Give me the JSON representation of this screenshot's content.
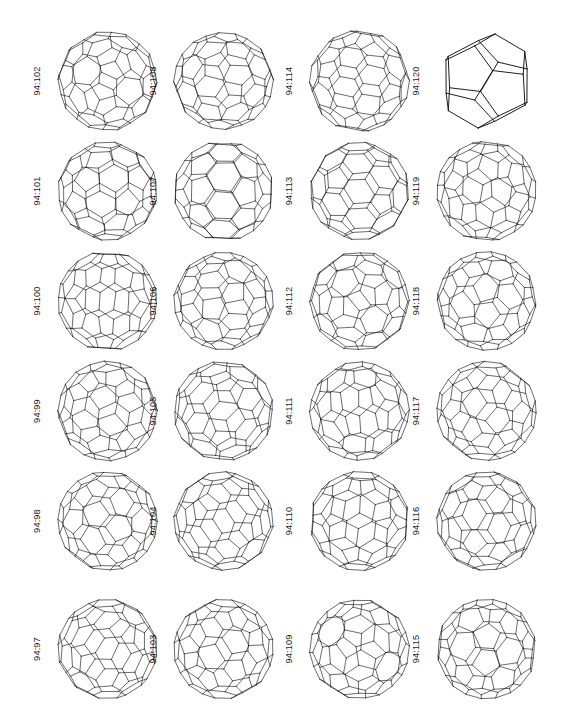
{
  "figure": {
    "kind": "fullerene-isomer-wireframe-plate",
    "background_color": "#ffffff",
    "line_color": "#111111",
    "grid": {
      "columns": 4,
      "rows": 6,
      "total_cells": 24
    },
    "label_orientation": "rotated-90-counterclockwise",
    "label_prefix": "94",
    "label_separator": ":"
  },
  "chart_data": {
    "type": "table",
    "title": "",
    "xlabel": "",
    "ylabel": "",
    "columns": 4,
    "rows": 6,
    "order": "column-major, bottom-to-top within each column",
    "categories": [
      "94:97",
      "94:98",
      "94:99",
      "94:100",
      "94:101",
      "94:102",
      "94:103",
      "94:104",
      "94:105",
      "94:106",
      "94:107",
      "94:108",
      "94:109",
      "94:110",
      "94:111",
      "94:112",
      "94:113",
      "94:114",
      "94:115",
      "94:116",
      "94:117",
      "94:118",
      "94:119",
      "94:120"
    ],
    "values": [
      97,
      98,
      99,
      100,
      101,
      102,
      103,
      104,
      105,
      106,
      107,
      108,
      109,
      110,
      111,
      112,
      113,
      114,
      115,
      116,
      117,
      118,
      119,
      120
    ]
  },
  "cells": [
    {
      "label": "94:102",
      "col": 0,
      "row": 0,
      "seed": 102,
      "style": "fine",
      "squash": 1.0,
      "tilt": -4
    },
    {
      "label": "94:108",
      "col": 1,
      "row": 0,
      "seed": 108,
      "style": "fine",
      "squash": 0.97,
      "tilt": 2
    },
    {
      "label": "94:114",
      "col": 2,
      "row": 0,
      "seed": 114,
      "style": "fine",
      "squash": 1.02,
      "tilt": -9
    },
    {
      "label": "94:120",
      "col": 3,
      "row": 0,
      "seed": 120,
      "style": "coarse",
      "squash": 0.98,
      "tilt": 0
    },
    {
      "label": "94:101",
      "col": 0,
      "row": 1,
      "seed": 101,
      "style": "fine",
      "squash": 0.99,
      "tilt": 6
    },
    {
      "label": "94:107",
      "col": 1,
      "row": 1,
      "seed": 107,
      "style": "fine",
      "squash": 1.0,
      "tilt": -2
    },
    {
      "label": "94:113",
      "col": 2,
      "row": 1,
      "seed": 113,
      "style": "medium",
      "squash": 0.98,
      "tilt": 4
    },
    {
      "label": "94:119",
      "col": 3,
      "row": 1,
      "seed": 119,
      "style": "fine",
      "squash": 1.01,
      "tilt": -6
    },
    {
      "label": "94:100",
      "col": 0,
      "row": 2,
      "seed": 100,
      "style": "fine",
      "squash": 1.0,
      "tilt": -3
    },
    {
      "label": "94:106",
      "col": 1,
      "row": 2,
      "seed": 106,
      "style": "fine",
      "squash": 0.98,
      "tilt": 5
    },
    {
      "label": "94:112",
      "col": 2,
      "row": 2,
      "seed": 112,
      "style": "medium",
      "squash": 1.0,
      "tilt": 1
    },
    {
      "label": "94:118",
      "col": 3,
      "row": 2,
      "seed": 118,
      "style": "fine",
      "squash": 0.99,
      "tilt": -5
    },
    {
      "label": "94:99",
      "col": 0,
      "row": 3,
      "seed": 99,
      "style": "medium",
      "squash": 1.0,
      "tilt": 3
    },
    {
      "label": "94:105",
      "col": 1,
      "row": 3,
      "seed": 105,
      "style": "fine",
      "squash": 1.0,
      "tilt": -7
    },
    {
      "label": "94:111",
      "col": 2,
      "row": 3,
      "seed": 111,
      "style": "medium",
      "squash": 0.99,
      "tilt": 2
    },
    {
      "label": "94:117",
      "col": 3,
      "row": 3,
      "seed": 117,
      "style": "fine",
      "squash": 1.0,
      "tilt": -4
    },
    {
      "label": "94:98",
      "col": 0,
      "row": 4,
      "seed": 98,
      "style": "medium",
      "squash": 1.0,
      "tilt": -2
    },
    {
      "label": "94:104",
      "col": 1,
      "row": 4,
      "seed": 104,
      "style": "medium",
      "squash": 0.99,
      "tilt": 6
    },
    {
      "label": "94:110",
      "col": 2,
      "row": 4,
      "seed": 110,
      "style": "fine",
      "squash": 1.0,
      "tilt": -3
    },
    {
      "label": "94:116",
      "col": 3,
      "row": 4,
      "seed": 116,
      "style": "fine",
      "squash": 1.0,
      "tilt": 4
    },
    {
      "label": "94:97",
      "col": 0,
      "row": 5,
      "seed": 97,
      "style": "fine",
      "squash": 1.0,
      "tilt": 2
    },
    {
      "label": "94:103",
      "col": 1,
      "row": 5,
      "seed": 103,
      "style": "medium",
      "squash": 1.0,
      "tilt": -5
    },
    {
      "label": "94:109",
      "col": 2,
      "row": 5,
      "seed": 109,
      "style": "fine",
      "squash": 1.0,
      "tilt": 3
    },
    {
      "label": "94:115",
      "col": 3,
      "row": 5,
      "seed": 115,
      "style": "fine",
      "squash": 1.0,
      "tilt": -6
    }
  ]
}
